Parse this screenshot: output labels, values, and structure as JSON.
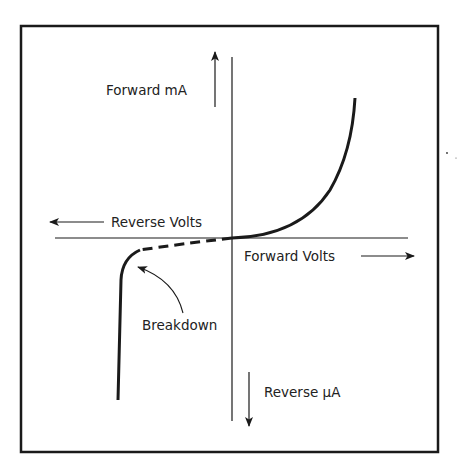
{
  "diagram": {
    "labels": {
      "forward_current": "Forward mA",
      "reverse_voltage": "Reverse Volts",
      "forward_voltage": "Forward Volts",
      "reverse_current": "Reverse μA",
      "breakdown": "Breakdown"
    },
    "colors": {
      "stroke": "#1a1a1a",
      "background": "#ffffff"
    }
  }
}
